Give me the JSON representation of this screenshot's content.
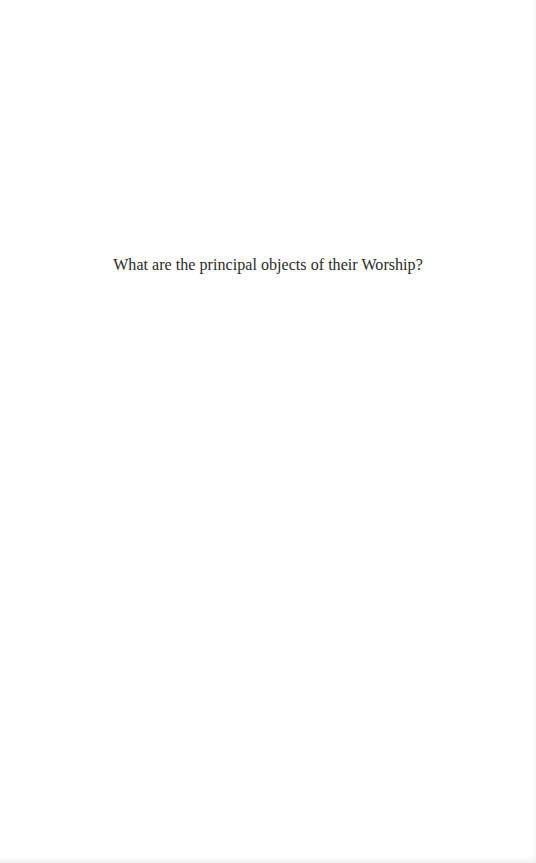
{
  "page": {
    "background_color": "#ffffff",
    "text_color": "#2a2a2a",
    "question": "What are the principal objects of their Worship?"
  }
}
